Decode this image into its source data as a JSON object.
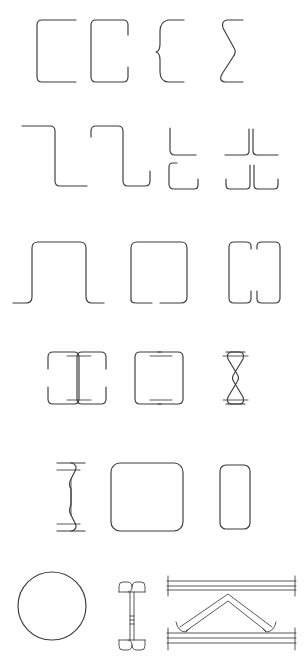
{
  "document": {
    "title": "Cold-Formed Steel Section Profiles Chart",
    "background_color": "#ffffff",
    "line_color": "#3a3a3a",
    "width_px": 305,
    "height_px": 670,
    "description": "Line-drawing catalogue of cold-formed / roll-formed steel cross-section profiles arranged in six rows."
  },
  "rows": [
    {
      "id": "row-1",
      "name": "channel-sections",
      "label": "Channel sections",
      "items": [
        {
          "id": "plain-channel",
          "label": "Plain channel (C section)"
        },
        {
          "id": "lipped-channel",
          "label": "Lipped channel (C section with lips)"
        },
        {
          "id": "curved-lip-channel",
          "label": "Channel with curved return flanges"
        },
        {
          "id": "sigma-channel",
          "label": "Sigma / zig-zag web section"
        }
      ]
    },
    {
      "id": "row-2",
      "name": "zed-and-angle-sections",
      "label": "Zed and angle sections",
      "items": [
        {
          "id": "plain-zed",
          "label": "Plain Z section"
        },
        {
          "id": "lipped-zed",
          "label": "Lipped Z section"
        },
        {
          "id": "plain-angle",
          "label": "Plain angle (L section)"
        },
        {
          "id": "lipped-angle",
          "label": "Lipped angle (L section with lips)"
        },
        {
          "id": "back-to-back-plain-angle",
          "label": "Back-to-back plain angles (T)"
        },
        {
          "id": "back-to-back-lipped-angle",
          "label": "Back-to-back lipped angles (T)"
        }
      ]
    },
    {
      "id": "row-3",
      "name": "hat-and-box-sections",
      "label": "Hat and box sections",
      "items": [
        {
          "id": "hat-section",
          "label": "Hat / top-hat section"
        },
        {
          "id": "closed-hat-section",
          "label": "Closed hat section"
        },
        {
          "id": "double-box-section",
          "label": "Twin closed box section"
        }
      ]
    },
    {
      "id": "row-4",
      "name": "built-up-i-sections",
      "label": "Built-up I sections",
      "items": [
        {
          "id": "back-to-back-lipped-channel-i",
          "label": "Back-to-back lipped channels (I section)"
        },
        {
          "id": "back-to-back-plain-channel-i",
          "label": "Back-to-back plain channels (I section)"
        },
        {
          "id": "back-to-back-sigma",
          "label": "Back-to-back sigma sections"
        }
      ]
    },
    {
      "id": "row-5",
      "name": "tubes-and-curved-sections",
      "label": "Tubes and curved sections",
      "items": [
        {
          "id": "curved-flange-i",
          "label": "Curved-flange built-up I section"
        },
        {
          "id": "square-hollow-section",
          "label": "Square hollow section (SHS)"
        },
        {
          "id": "rectangular-hollow-section",
          "label": "Rectangular hollow section (RHS)"
        }
      ]
    },
    {
      "id": "row-6",
      "name": "tubes-and-assemblies",
      "label": "Tubes and built-up assemblies",
      "items": [
        {
          "id": "circular-hollow-section",
          "label": "Circular hollow section (CHS)"
        },
        {
          "id": "built-up-lattice-stud",
          "label": "Built-up I stud with lipped flanges"
        },
        {
          "id": "lattice-truss-girder",
          "label": "Lattice truss girder with chords and diagonals"
        }
      ]
    }
  ]
}
